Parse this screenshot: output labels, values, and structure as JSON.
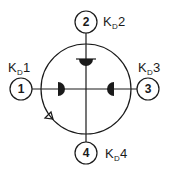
{
  "diagram": {
    "type": "four-port junction",
    "ports": [
      {
        "number": "1",
        "label_main": "K",
        "label_sub": "D",
        "label_index": "1",
        "position": "west"
      },
      {
        "number": "2",
        "label_main": "K",
        "label_sub": "D",
        "label_index": "2",
        "position": "north"
      },
      {
        "number": "3",
        "label_main": "K",
        "label_sub": "D",
        "label_index": "3",
        "position": "east"
      },
      {
        "number": "4",
        "label_main": "K",
        "label_sub": "D",
        "label_index": "4",
        "position": "south"
      }
    ],
    "colors": {
      "stroke": "#1a1a1a",
      "background": "#ffffff"
    }
  }
}
